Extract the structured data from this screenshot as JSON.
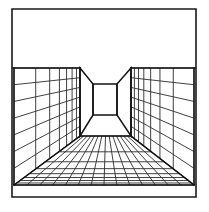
{
  "figure": {
    "kind": "line-drawing",
    "canvas_width": 209,
    "canvas_height": 212,
    "background_color": "#ffffff",
    "line_color": "#141414",
    "grid_color": "#2b2b2b"
  },
  "frame": {
    "name": "outer-border",
    "left": 12,
    "top": 9,
    "right": 196,
    "bottom": 197,
    "stroke_width": 1.6
  },
  "perspective": {
    "vanishing_point_x": 105,
    "vanishing_point_y": 99,
    "ceiling_line_y": 68,
    "floor_front_y": 196,
    "room_left_x": 13,
    "room_right_x": 195
  },
  "alcove": {
    "name": "back-wall-square",
    "left": 93,
    "top": 84,
    "right": 117,
    "bottom": 115,
    "note": "small bright square at the end of the recess"
  },
  "side_walls": {
    "left": {
      "name": "left-wall-panel",
      "front_x": 14,
      "front_top_y": 68,
      "front_bottom_y": 185,
      "back_x": 80,
      "back_top_y": 68,
      "back_bottom_y": 136,
      "columns": 7,
      "rows": 7
    },
    "right": {
      "name": "right-wall-panel",
      "front_x": 194,
      "front_top_y": 68,
      "front_bottom_y": 185,
      "back_x": 131,
      "back_top_y": 68,
      "back_bottom_y": 136,
      "columns": 7,
      "rows": 7
    }
  },
  "recess_panels": {
    "left": {
      "name": "left-recess-panel",
      "outer_top": [
        80,
        68
      ],
      "outer_bottom": [
        80,
        136
      ],
      "inner_top": [
        93,
        84
      ],
      "inner_bottom": [
        93,
        115
      ]
    },
    "right": {
      "name": "right-recess-panel",
      "outer_top": [
        131,
        68
      ],
      "outer_bottom": [
        131,
        136
      ],
      "inner_top": [
        117,
        84
      ],
      "inner_bottom": [
        117,
        115
      ]
    }
  },
  "floor": {
    "name": "floor-grid",
    "front_left": [
      14,
      185
    ],
    "front_right": [
      194,
      185
    ],
    "back_left": [
      80,
      136
    ],
    "back_right": [
      131,
      136
    ],
    "columns": 14,
    "rows": 8,
    "note": "converging orthogonals meet at vanishing point"
  },
  "ceiling": {
    "name": "ceiling-plane",
    "top_y": 10,
    "bottom_y": 68,
    "gridded": false
  }
}
